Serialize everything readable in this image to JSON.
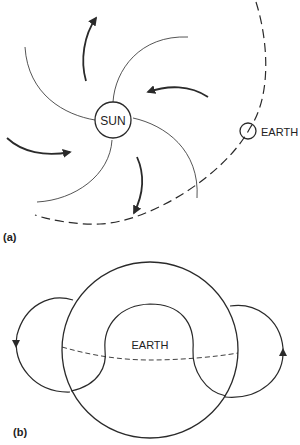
{
  "panel_a": {
    "label": "(a)",
    "sun_label": "SUN",
    "earth_label": "EARTH",
    "elements": [
      "spiral-field-lines",
      "rotation-arrows",
      "earth-orbit-dashed"
    ]
  },
  "panel_b": {
    "label": "(b)",
    "earth_label": "EARTH",
    "elements": [
      "outer-circle",
      "inner-hump",
      "dashed-equator",
      "left-loop-arrow-down",
      "right-loop-arrow-up"
    ]
  },
  "colors": {
    "ink": "#2a2a2a",
    "background": "#ffffff"
  }
}
